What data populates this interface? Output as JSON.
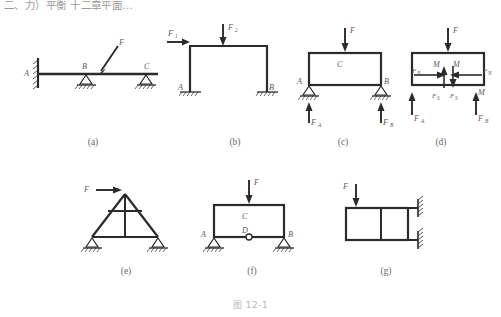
{
  "page": {
    "top_text": "二、力）平衡  十二章平面...",
    "figure_caption": "图 12-1"
  },
  "panels": [
    {
      "id": "a",
      "label": "(a)",
      "description": "continuous beam with fixed wall at A and two supports at B and C, inclined load F",
      "node_labels": [
        "A",
        "B",
        "C"
      ],
      "load_labels": [
        "F"
      ]
    },
    {
      "id": "b",
      "label": "(b)",
      "description": "portal frame with horizontal load F1 and vertical load F2, fixed bases A and B",
      "node_labels": [
        "A",
        "B"
      ],
      "load_labels": [
        "F",
        "1",
        "F",
        "2"
      ]
    },
    {
      "id": "c",
      "label": "(c)",
      "description": "closed frame C with vertical load F and pin supports A, B with reactions FA and FB",
      "node_labels": [
        "A",
        "B",
        "C"
      ],
      "load_labels": [
        "F",
        "F",
        "A",
        "F",
        "B"
      ]
    },
    {
      "id": "d",
      "label": "(d)",
      "description": "free body diagram showing internal moments M, normal forces FN and shear forces FS",
      "node_labels": [],
      "load_labels": [
        "F",
        "M",
        "M",
        "F",
        "N",
        "F",
        "N",
        "F",
        "S",
        "F",
        "S",
        "F",
        "A",
        "F",
        "B",
        "M"
      ]
    },
    {
      "id": "e",
      "label": "(e)",
      "description": "triangular truss with horizontal tie and vertical member, horizontal load F at apex",
      "node_labels": [],
      "load_labels": [
        "F"
      ]
    },
    {
      "id": "f",
      "label": "(f)",
      "description": "closed frame C with internal hinge D on bottom chord, vertical load F, supports A and B",
      "node_labels": [
        "A",
        "B",
        "C",
        "D"
      ],
      "load_labels": [
        "F"
      ]
    },
    {
      "id": "g",
      "label": "(g)",
      "description": "rectangular frame with interior vertical member fixed to a wall at two points, vertical load F",
      "node_labels": [],
      "load_labels": [
        "F"
      ]
    }
  ],
  "symbols": {
    "F": "F",
    "M": "M",
    "A": "A",
    "B": "B",
    "C": "C",
    "D": "D",
    "sub_1": "1",
    "sub_2": "2",
    "sub_A": "A",
    "sub_B": "B",
    "sub_N": "N",
    "sub_S": "S"
  },
  "colors": {
    "line": "#2b2b2b",
    "label": "#5d5d5d",
    "caption": "#b8b8b8",
    "background": "#ffffff"
  }
}
